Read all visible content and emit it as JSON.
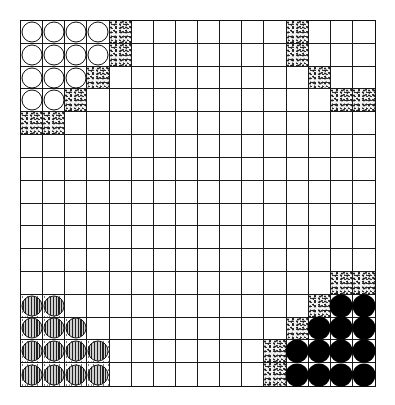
{
  "board": {
    "rows": 16,
    "cols": 16,
    "line_color": "#1a1a1a",
    "legend": {
      "W": "white-circle-piece",
      "B": "black-circle-piece",
      "S": "striped-circle-piece",
      "s": "stippled-square",
      ".": "empty-square"
    },
    "grid": [
      "WWWWs.......s...",
      "WWWWs.......s...",
      "WWWs.........s..",
      "WWs...........ss",
      "ss..............",
      "................",
      "................",
      "................",
      "................",
      "................",
      "................",
      "..............ss",
      "SS...........sBB",
      "SSS.........sBBB",
      "SSSS.......sBBBB",
      "SSSS.......sBBBB"
    ]
  }
}
